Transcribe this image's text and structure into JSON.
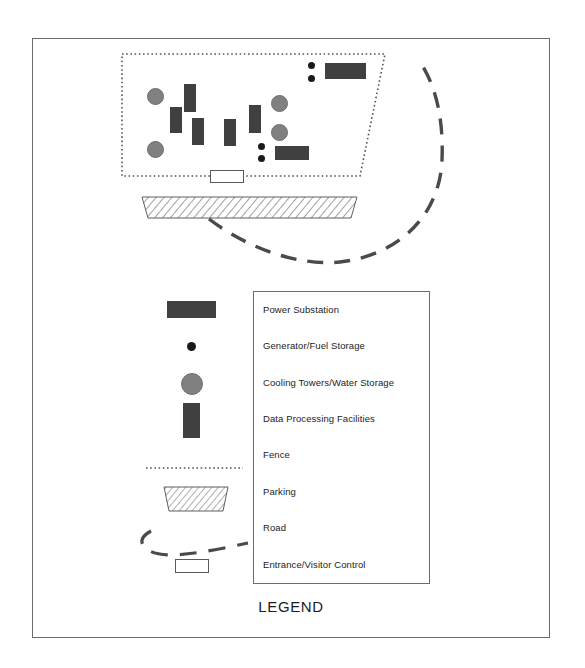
{
  "figure": {
    "title": "LEGEND",
    "kind": "site-plan-map"
  },
  "colors": {
    "building_fill": "#404040",
    "tank_fill": "#808080",
    "generator_fill": "#1a1a1a",
    "line": "#4a4a4a",
    "frame": "#6b6b6b",
    "entrance_fill": "#ffffff",
    "parking_hatch": "#6e6e6e"
  },
  "legend": {
    "items": [
      {
        "label": "Power Substation",
        "symbol": "filled-rectangle-horizontal-icon"
      },
      {
        "label": "Generator/Fuel Storage",
        "symbol": "small-black-dot-icon"
      },
      {
        "label": "Cooling Towers/Water Storage",
        "symbol": "gray-circle-icon"
      },
      {
        "label": "Data Processing Facilities",
        "symbol": "filled-rectangle-vertical-icon"
      },
      {
        "label": "Fence",
        "symbol": "dotted-line-icon"
      },
      {
        "label": "Parking",
        "symbol": "hatched-trapezoid-icon"
      },
      {
        "label": "Road",
        "symbol": "dashed-curve-icon"
      },
      {
        "label": "Entrance/Visitor Control",
        "symbol": "open-rectangle-icon"
      }
    ]
  },
  "map": {
    "fence": {
      "name": "perimeter-fence",
      "points": "122,54 385,54 360,176 122,176",
      "style": "dotted"
    },
    "entrance_gate": {
      "name": "entrance-visitor-control",
      "x": 210,
      "y": 170,
      "w": 34,
      "h": 13
    },
    "parking": {
      "name": "parking-lot",
      "points": "142,197 357,197 351,218 148,218",
      "style": "hatched-trapezoid"
    },
    "road": {
      "name": "access-road",
      "path": "M 209,219 C 250,250 300,266 340,262 C 400,255 440,215 442,160 C 444,110 432,80 420,62",
      "style": "dashed"
    },
    "buildings": [
      {
        "name": "data-processing-facility",
        "x": 184,
        "y": 84,
        "w": 12,
        "h": 28
      },
      {
        "name": "data-processing-facility",
        "x": 170,
        "y": 107,
        "w": 12,
        "h": 26
      },
      {
        "name": "data-processing-facility",
        "x": 192,
        "y": 118,
        "w": 12,
        "h": 27
      },
      {
        "name": "data-processing-facility",
        "x": 224,
        "y": 119,
        "w": 12,
        "h": 27
      },
      {
        "name": "data-processing-facility",
        "x": 249,
        "y": 105,
        "w": 12,
        "h": 28
      },
      {
        "name": "power-substation",
        "x": 325,
        "y": 63,
        "w": 41,
        "h": 16
      },
      {
        "name": "power-substation",
        "x": 275,
        "y": 146,
        "w": 34,
        "h": 14
      }
    ],
    "tanks": [
      {
        "name": "cooling-tower",
        "x": 147,
        "y": 88,
        "d": 17
      },
      {
        "name": "cooling-tower",
        "x": 147,
        "y": 141,
        "d": 17
      },
      {
        "name": "cooling-tower",
        "x": 271,
        "y": 95,
        "d": 17
      },
      {
        "name": "cooling-tower",
        "x": 271,
        "y": 124,
        "d": 17
      }
    ],
    "generators": [
      {
        "name": "generator-fuel-storage",
        "x": 308,
        "y": 62,
        "d": 7
      },
      {
        "name": "generator-fuel-storage",
        "x": 308,
        "y": 75,
        "d": 7
      },
      {
        "name": "generator-fuel-storage",
        "x": 258,
        "y": 143,
        "d": 7
      },
      {
        "name": "generator-fuel-storage",
        "x": 258,
        "y": 155,
        "d": 7
      }
    ]
  }
}
